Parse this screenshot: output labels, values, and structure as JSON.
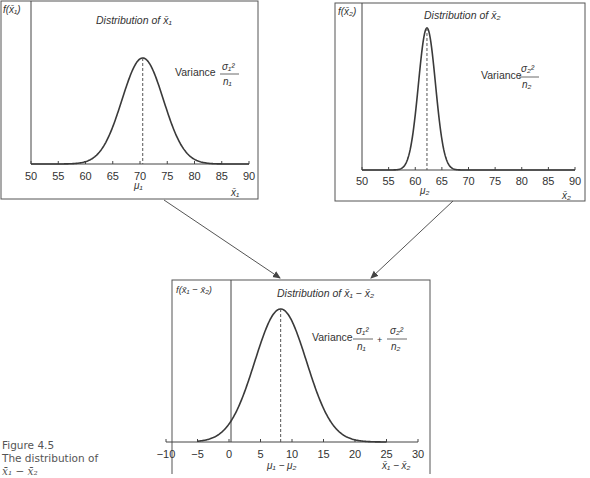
{
  "caption": {
    "figure_label": "Figure 4.5",
    "text": "The distribution of",
    "expr": "x̄₁ − x̄₂"
  },
  "colors": {
    "curve": "#3a3a3a",
    "frame": "#555555",
    "axis": "#444444",
    "text": "#333333"
  },
  "chart_data": [
    {
      "type": "line",
      "title": "Distribution of x̄₁",
      "ylabel": "f(x̄₁)",
      "xlabel": "x̄₁",
      "mean_label": "μ₁",
      "variance_label": "Variance σ₁²/n₁",
      "x_ticks": [
        50,
        55,
        60,
        65,
        70,
        75,
        80,
        85,
        90
      ],
      "xlim": [
        50,
        90
      ],
      "distribution": {
        "kind": "normal",
        "mean": 70.5,
        "sd": 3.8
      },
      "grid": false
    },
    {
      "type": "line",
      "title": "Distribution of x̄₂",
      "ylabel": "f(x̄₂)",
      "xlabel": "x̄₂",
      "mean_label": "μ₂",
      "variance_label": "Variance σ₂²/n₂",
      "x_ticks": [
        50,
        55,
        60,
        65,
        70,
        75,
        80,
        85,
        90
      ],
      "xlim": [
        50,
        90
      ],
      "distribution": {
        "kind": "normal",
        "mean": 62.2,
        "sd": 1.6
      },
      "grid": false
    },
    {
      "type": "line",
      "title": "Distribution of x̄₁ − x̄₂",
      "ylabel": "f(x̄₁ − x̄₂)",
      "xlabel": "x̄₁ − x̄₂",
      "mean_label": "μ₁ − μ₂",
      "variance_label": "Variance σ₁²/n₁ + σ₂²/n₂",
      "x_ticks": [
        -10,
        -5,
        0,
        5,
        10,
        15,
        20,
        25,
        30
      ],
      "xlim": [
        -10,
        30
      ],
      "distribution": {
        "kind": "normal",
        "mean": 8.2,
        "sd": 4.1
      },
      "grid": false
    }
  ],
  "panels": [
    {
      "title_prefix": "Distribution of ",
      "title_var": "x̄₁",
      "ylabel": "f(x̄₁)",
      "xlabel": "x̄₁",
      "mean_label": "μ₁",
      "variance_word": "Variance",
      "var_num": "σ₁²",
      "var_den": "n₁"
    },
    {
      "title_prefix": "Distribution of ",
      "title_var": "x̄₂",
      "ylabel": "f(x̄₂)",
      "xlabel": "x̄₂",
      "mean_label": "μ₂",
      "variance_word": "Variance",
      "var_num": "σ₂²",
      "var_den": "n₂"
    },
    {
      "title_prefix": "Distribution of ",
      "title_var": "x̄₁ − x̄₂",
      "ylabel": "f(x̄₁ − x̄₂)",
      "xlabel": "x̄₁ − x̄₂",
      "mean_label": "μ₁ − μ₂",
      "variance_word": "Variance",
      "var_num": "σ₁²",
      "var_den": "n₁",
      "plus": "+",
      "var_num2": "σ₂²",
      "var_den2": "n₂"
    }
  ]
}
